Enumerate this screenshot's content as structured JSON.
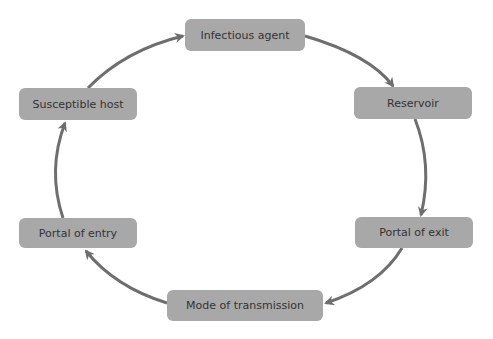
{
  "diagram": {
    "nodes": [
      {
        "id": "infectious-agent",
        "label": "Infectious agent"
      },
      {
        "id": "reservoir",
        "label": "Reservoir"
      },
      {
        "id": "portal-of-exit",
        "label": "Portal of exit"
      },
      {
        "id": "mode-of-transmission",
        "label": "Mode of transmission"
      },
      {
        "id": "portal-of-entry",
        "label": "Portal of entry"
      },
      {
        "id": "susceptible-host",
        "label": "Susceptible host"
      }
    ],
    "edges": [
      {
        "from": "infectious-agent",
        "to": "reservoir"
      },
      {
        "from": "reservoir",
        "to": "portal-of-exit"
      },
      {
        "from": "portal-of-exit",
        "to": "mode-of-transmission"
      },
      {
        "from": "mode-of-transmission",
        "to": "portal-of-entry"
      },
      {
        "from": "portal-of-entry",
        "to": "susceptible-host"
      },
      {
        "from": "susceptible-host",
        "to": "infectious-agent"
      }
    ],
    "colors": {
      "node_fill": "#a8a8a8",
      "text": "#333333",
      "arrow": "#6e6e6e"
    }
  }
}
